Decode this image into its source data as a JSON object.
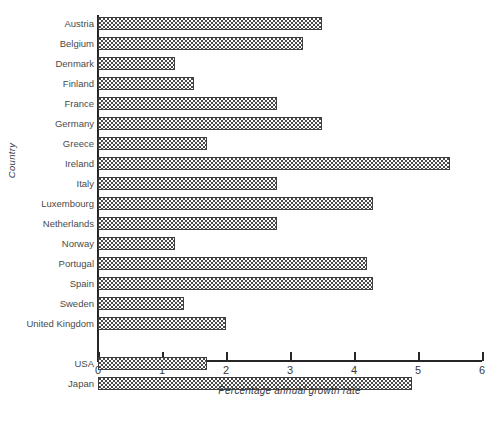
{
  "chart_data": {
    "type": "bar",
    "orientation": "horizontal",
    "title": "",
    "xlabel": "Percentage annual growth rate",
    "ylabel": "Country",
    "xlim": [
      0,
      6
    ],
    "xticks": [
      0,
      1,
      2,
      3,
      4,
      5,
      6
    ],
    "xtick_labels": [
      "0",
      "1",
      "2",
      "3",
      "4",
      "5",
      "6"
    ],
    "grid": false,
    "legend": "none",
    "categories": [
      "Austria",
      "Belgium",
      "Denmark",
      "Finland",
      "France",
      "Germany",
      "Greece",
      "Ireland",
      "Italy",
      "Luxembourg",
      "Netherlands",
      "Norway",
      "Portugal",
      "Spain",
      "Sweden",
      "United Kingdom",
      "",
      "USA",
      "Japan"
    ],
    "values": [
      3.5,
      3.2,
      1.2,
      1.5,
      2.8,
      3.5,
      1.7,
      5.5,
      2.8,
      4.3,
      2.8,
      1.2,
      4.2,
      4.3,
      1.35,
      2.0,
      null,
      1.7,
      4.9
    ]
  },
  "colors": {
    "axis": "#262626",
    "bar_border": "#3d3d3d",
    "bar_fill": "#fbfbfb",
    "bar_dots": "#4a4a4a",
    "text": "#3a3a3a"
  }
}
